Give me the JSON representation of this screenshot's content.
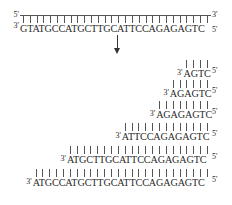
{
  "template": {
    "top_left_label": "5'",
    "top_right_label": "3'",
    "bottom_left_label": "3'",
    "bottom_right_label": "5'",
    "sequence": "GTATGCCATGCTTGCATTCCAGAGAGTC"
  },
  "arrow": {
    "direction": "down"
  },
  "fragments": [
    {
      "left_label": "3'",
      "sequence": "AGTC",
      "right_label": "5'"
    },
    {
      "left_label": "3'",
      "sequence": "AGAGTC",
      "right_label": "5'"
    },
    {
      "left_label": "3'",
      "sequence": "AGAGAGTC",
      "right_label": "5'"
    },
    {
      "left_label": "3'",
      "sequence": "ATTCCAGAGAGTC",
      "right_label": "5'"
    },
    {
      "left_label": "3'",
      "sequence": "ATGCTTGCATTCCAGAGAGTC",
      "right_label": "5'"
    },
    {
      "left_label": "3'",
      "sequence": "ATGCCATGCTTGCATTCCAGAGAGTC",
      "right_label": "5'"
    }
  ]
}
